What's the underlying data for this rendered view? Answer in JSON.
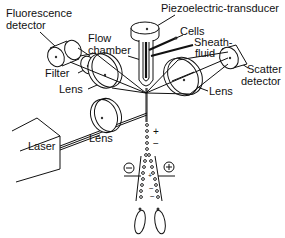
{
  "diagram": {
    "labels": {
      "fluorescence_detector_line1": "Fluorescence",
      "fluorescence_detector_line2": "detector",
      "piezo": "Piezoelectric-transducer",
      "flow_chamber_line1": "Flow",
      "flow_chamber_line2": "chamber",
      "cells": "Cells",
      "sheath_line1": "Sheath-",
      "sheath_line2": "fluid",
      "filter": "Filter",
      "lens_left": "Lens",
      "lens_bottom": "Lens",
      "lens_right": "Lens",
      "scatter_line1": "Scatter",
      "scatter_line2": "detector",
      "laser": "Laser"
    },
    "charges": {
      "drop_plus": "+",
      "drop_minus": "−",
      "plate_negative": "⊖",
      "plate_positive": "⊕"
    },
    "colors": {
      "ink": "#111111",
      "background": "#ffffff"
    }
  }
}
